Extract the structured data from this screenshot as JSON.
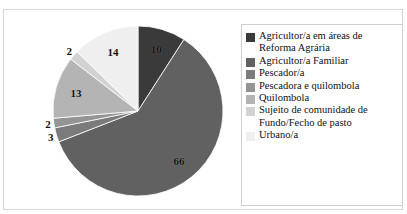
{
  "frame": {
    "border_color": "#d6d6d6",
    "background": "#ffffff",
    "clipped_top_text": "............."
  },
  "legend": {
    "position": "right",
    "border_color": "#cfcfcf",
    "items": [
      {
        "label": "Agricultor/a em áreas de Reforma Agrária",
        "color": "#3a3a3a"
      },
      {
        "label": "Agricultor/a Familiar",
        "color": "#616161"
      },
      {
        "label": "Pescador/a",
        "color": "#7b7b7b"
      },
      {
        "label": "Pescadora e quilombola",
        "color": "#949494"
      },
      {
        "label": "Quilombola",
        "color": "#b4b4b4"
      },
      {
        "label": "Sujeito de comunidade de Fundo/Fecho de pasto",
        "color": "#d2d2d2"
      },
      {
        "label": "Urbano/a",
        "color": "#efefef"
      }
    ]
  },
  "labels": {
    "l0": "10",
    "l1": "66",
    "l2": "3",
    "l3": "2",
    "l4": "13",
    "l5": "2",
    "l6": "14"
  },
  "chart_data": {
    "type": "pie",
    "title": "",
    "subtitle": "",
    "xlabel": "",
    "ylabel": "",
    "grid": false,
    "legend_position": "right",
    "start_angle_deg": 0,
    "direction": "clockwise",
    "total": 110,
    "categories": [
      "Agricultor/a em áreas de Reforma Agrária",
      "Agricultor/a Familiar",
      "Pescador/a",
      "Pescadora e quilombola",
      "Quilombola",
      "Sujeito de comunidade de Fundo/Fecho de pasto",
      "Urbano/a"
    ],
    "values": [
      10,
      66,
      3,
      2,
      13,
      2,
      14
    ],
    "data_labels": [
      "10",
      "66",
      "3",
      "2",
      "13",
      "2",
      "14"
    ],
    "colors": [
      "#3a3a3a",
      "#616161",
      "#7b7b7b",
      "#949494",
      "#b4b4b4",
      "#d2d2d2",
      "#efefef"
    ]
  }
}
